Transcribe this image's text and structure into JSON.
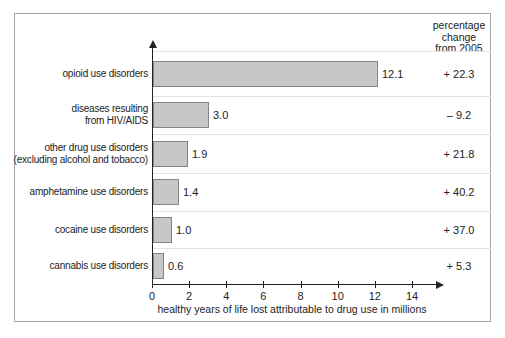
{
  "header": {
    "pct_column_title": "percentage\nchange\nfrom 2005"
  },
  "chart_data": {
    "type": "bar",
    "orientation": "horizontal",
    "title": "",
    "xlabel": "healthy years of life lost attributable to drug use in millions",
    "ylabel": "",
    "xlim": [
      0,
      14
    ],
    "x_ticks": [
      "0",
      "2",
      "4",
      "6",
      "8",
      "10",
      "12",
      "14"
    ],
    "grid": "row separators only",
    "bar_color": "#c7c7c7",
    "bar_border_color": "#858585",
    "categories": [
      "opioid use disorders",
      "diseases resulting from HIV/AIDS",
      "other drug use disorders (excluding alcohol and tobacco)",
      "amphetamine use disorders",
      "cocaine use disorders",
      "cannabis use disorders"
    ],
    "series": [
      {
        "name": "healthy years of life lost (millions)",
        "values": [
          12.1,
          3.0,
          1.9,
          1.4,
          1.0,
          0.6
        ]
      },
      {
        "name": "percentage change from 2005",
        "values": [
          22.3,
          -9.2,
          21.8,
          40.2,
          37.0,
          5.3
        ]
      }
    ],
    "rows": [
      {
        "label_lines": [
          "opioid use disorders"
        ],
        "value": 12.1,
        "value_label": "12.1",
        "pct_label": "+ 22.3"
      },
      {
        "label_lines": [
          "diseases resulting",
          "from HIV/AIDS"
        ],
        "value": 3.0,
        "value_label": "3.0",
        "pct_label": "– 9.2"
      },
      {
        "label_lines": [
          "other drug use disorders",
          "(excluding alcohol and tobacco)"
        ],
        "value": 1.9,
        "value_label": "1.9",
        "pct_label": "+ 21.8"
      },
      {
        "label_lines": [
          "amphetamine use disorders"
        ],
        "value": 1.4,
        "value_label": "1.4",
        "pct_label": "+ 40.2"
      },
      {
        "label_lines": [
          "cocaine use disorders"
        ],
        "value": 1.0,
        "value_label": "1.0",
        "pct_label": "+ 37.0"
      },
      {
        "label_lines": [
          "cannabis use disorders"
        ],
        "value": 0.6,
        "value_label": "0.6",
        "pct_label": "+ 5.3"
      }
    ]
  }
}
